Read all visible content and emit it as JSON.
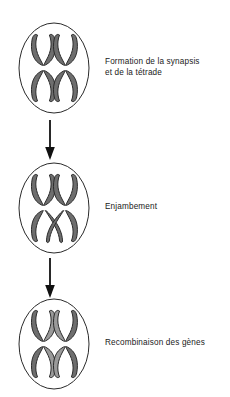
{
  "figure": {
    "title_visible": false,
    "background_color": "#ffffff"
  },
  "colors": {
    "outline": "#1a1a1a",
    "cell_membrane": "#2b2b2b",
    "chromatid_fill_dark": "#6e6e6e",
    "chromatid_fill_light": "#9a9a9a",
    "chromatid_stroke": "#2b2b2b",
    "centromere": "#ffffff",
    "text": "#1a1a1a",
    "arrow": "#111111"
  },
  "stages": [
    {
      "id": "synapsis",
      "label": "Formation de la synapsis\net de la tétrade",
      "cell_name": "cell-synapsis",
      "chromosome_count": 2,
      "crossed": false
    },
    {
      "id": "crossing-over",
      "label": "Enjambement",
      "cell_name": "cell-enjambement",
      "chromosome_count": 2,
      "crossed": true
    },
    {
      "id": "recombination",
      "label": "Recombinaison des gènes",
      "cell_name": "cell-recombinaison",
      "chromosome_count": 2,
      "crossed": false
    }
  ],
  "arrows": [
    {
      "id": "arrow-1",
      "from": "synapsis",
      "to": "crossing-over",
      "direction": "down"
    },
    {
      "id": "arrow-2",
      "from": "crossing-over",
      "to": "recombination",
      "direction": "down"
    }
  ]
}
